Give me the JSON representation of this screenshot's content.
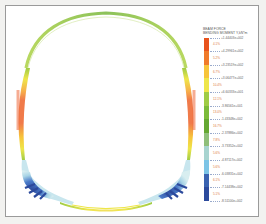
{
  "diagram": {
    "type": "tunnel-lining-bending-moment-contour",
    "shape": "horseshoe-tunnel-section"
  },
  "legend": {
    "title_line1": "BEAM FORCE",
    "title_line2": "BENDING MOMENT Y,kN*m",
    "values": [
      "+1.44403e+002",
      "+4.29961e+002",
      "+3.23519e+002",
      "+3.06477e+002",
      "+6.60333e+001",
      "-3.86561e+001",
      "-1.43348e+002",
      "-2.37886e+002",
      "-3.73352e+002",
      "-4.87117e+002",
      "-6.03831e+002",
      "-7.14438e+002",
      "-8.51100e+002"
    ],
    "percentages": [
      "4.1%",
      "5.2%",
      "6.7%",
      "10.4%",
      "12.1%",
      "13.0%",
      "16.7%",
      "7.8%",
      "5.6%",
      "5.6%",
      "6.1%",
      "5.1%"
    ],
    "colors": [
      "#e8531d",
      "#f07a2a",
      "#f7c43a",
      "#eee64a",
      "#9fcc45",
      "#7cbb3a",
      "#64a832",
      "#8fbf7a",
      "#a8d4d0",
      "#7cc4e6",
      "#3a63b0",
      "#2c4a9c"
    ]
  }
}
